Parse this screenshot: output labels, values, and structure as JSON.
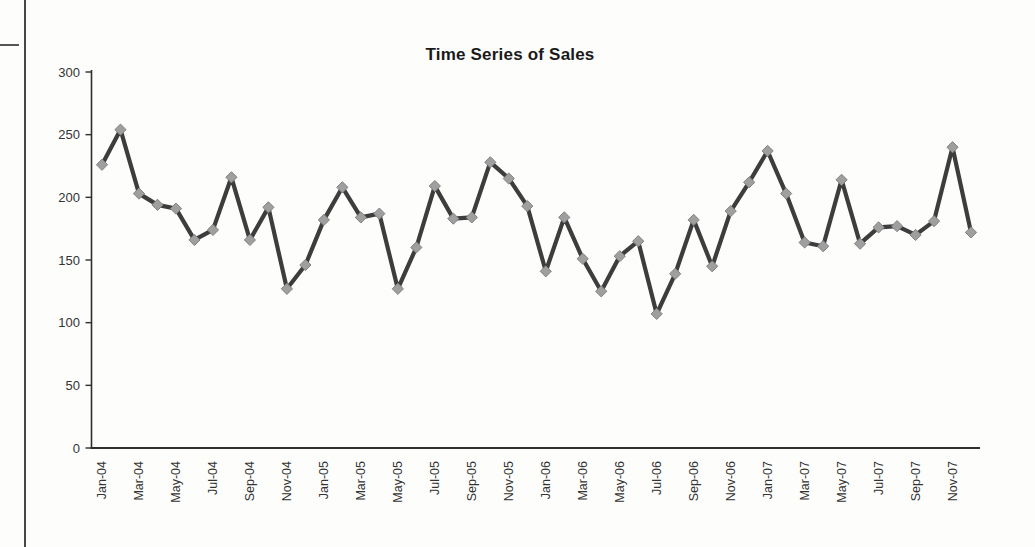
{
  "chart_data": {
    "type": "line",
    "title": "Time Series of Sales",
    "xlabel": "",
    "ylabel": "",
    "categories": [
      "Jan-04",
      "Feb-04",
      "Mar-04",
      "Apr-04",
      "May-04",
      "Jun-04",
      "Jul-04",
      "Aug-04",
      "Sep-04",
      "Oct-04",
      "Nov-04",
      "Dec-04",
      "Jan-05",
      "Feb-05",
      "Mar-05",
      "Apr-05",
      "May-05",
      "Jun-05",
      "Jul-05",
      "Aug-05",
      "Sep-05",
      "Oct-05",
      "Nov-05",
      "Dec-05",
      "Jan-06",
      "Feb-06",
      "Mar-06",
      "Apr-06",
      "May-06",
      "Jun-06",
      "Jul-06",
      "Aug-06",
      "Sep-06",
      "Oct-06",
      "Nov-06",
      "Dec-06",
      "Jan-07",
      "Feb-07",
      "Mar-07",
      "Apr-07",
      "May-07",
      "Jun-07",
      "Jul-07",
      "Aug-07",
      "Sep-07",
      "Oct-07",
      "Nov-07",
      "Dec-07"
    ],
    "values": [
      226,
      254,
      203,
      194,
      191,
      166,
      174,
      216,
      166,
      192,
      127,
      146,
      182,
      208,
      184,
      187,
      127,
      160,
      209,
      183,
      184,
      228,
      215,
      193,
      141,
      184,
      151,
      125,
      153,
      165,
      107,
      139,
      182,
      145,
      189,
      212,
      237,
      203,
      164,
      161,
      214,
      163,
      176,
      177,
      170,
      181,
      240,
      172
    ],
    "x_tick_step": 2,
    "y_ticks": [
      0,
      50,
      100,
      150,
      200,
      250,
      300
    ],
    "ylim": [
      0,
      300
    ],
    "grid": false,
    "legend": "none",
    "styles": {
      "line_color": "#3d3d3d",
      "marker": "diamond",
      "marker_color": "#9f9f9f",
      "marker_edge_color": "#828282",
      "axis_color": "#2f2f2f",
      "label_color": "#333333",
      "title_color": "#1a1a1a"
    }
  }
}
